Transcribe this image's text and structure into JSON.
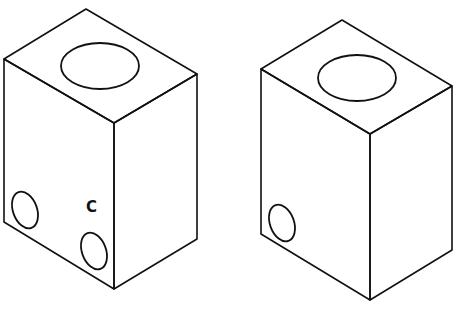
{
  "diagram": {
    "type": "isometric-drawing",
    "stroke_color": "#111111",
    "background": "#ffffff",
    "blocks": [
      {
        "name": "left-block",
        "vertices": {
          "top": [
            86,
            9
          ],
          "left_top": [
            4,
            59
          ],
          "right_top": [
            197,
            74
          ],
          "front_top": [
            114,
            123
          ],
          "left_bottom": [
            4,
            222
          ],
          "front_bottom": [
            114,
            289
          ],
          "right_bottom": [
            197,
            239
          ]
        },
        "top_hole": {
          "cx": 100,
          "cy": 66,
          "rx": 39,
          "ry": 23
        },
        "side_holes": [
          {
            "cx": 25,
            "cy": 210,
            "rx": 12,
            "ry": 19,
            "rotate": -20
          },
          {
            "cx": 94,
            "cy": 251,
            "rx": 12,
            "ry": 19,
            "rotate": -20
          }
        ],
        "label": {
          "text": "C",
          "x": 86,
          "y": 200
        }
      },
      {
        "name": "right-block",
        "vertices": {
          "top": [
            342,
            20
          ],
          "left_top": [
            261,
            69
          ],
          "right_top": [
            452,
            86
          ],
          "front_top": [
            370,
            134
          ],
          "left_bottom": [
            261,
            234
          ],
          "front_bottom": [
            370,
            300
          ],
          "right_bottom": [
            452,
            250
          ]
        },
        "top_hole": {
          "cx": 357,
          "cy": 78,
          "rx": 39,
          "ry": 23
        },
        "side_holes": [
          {
            "cx": 282,
            "cy": 223,
            "rx": 12,
            "ry": 19,
            "rotate": -20
          }
        ]
      }
    ]
  }
}
